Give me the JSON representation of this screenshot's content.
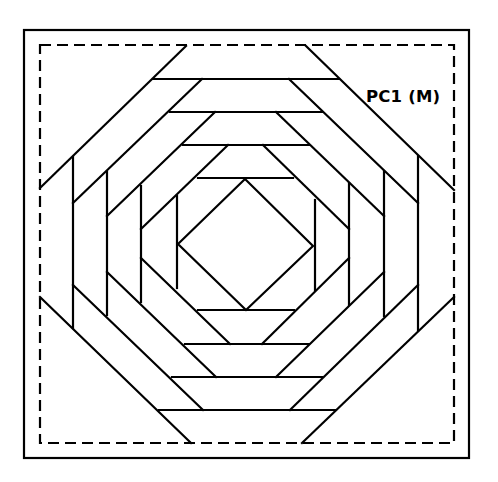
{
  "diagram": {
    "type": "quilt-block-pattern",
    "pattern": "pineapple",
    "label": "PC1 (M)",
    "colors": {
      "line": "#000000",
      "background": "#ffffff"
    },
    "outer_frame": {
      "x1": 24,
      "y1": 30,
      "x2": 469,
      "y2": 458
    },
    "seam_allowance": {
      "x1": 40,
      "y1": 45,
      "x2": 454,
      "y2": 443,
      "style": "dashed"
    },
    "center_diamond": [
      [
        178,
        244
      ],
      [
        245,
        179
      ],
      [
        313,
        246
      ],
      [
        246,
        310
      ]
    ],
    "rounds": 4
  }
}
